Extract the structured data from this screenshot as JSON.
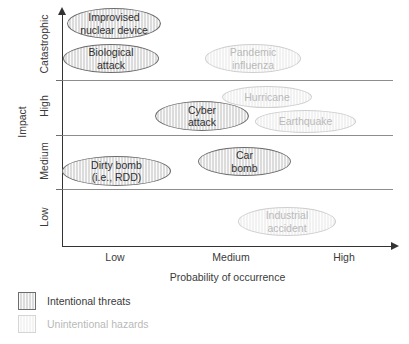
{
  "chart_data": {
    "type": "scatter",
    "title": "",
    "xlabel": "Probability of occurrence",
    "ylabel": "Impact",
    "x_tick_labels": [
      "Low",
      "Medium",
      "High"
    ],
    "y_tick_labels": [
      "Catastrophic",
      "High",
      "Medium",
      "Low"
    ],
    "grid": "horizontal band dividers only",
    "legend_position": "below-plot-left",
    "categories_legend": [
      {
        "key": "intentional",
        "label": "Intentional threats",
        "fill": "#dcdcdc",
        "stroke": "#6d6d6d",
        "text": "#2f2f2f"
      },
      {
        "key": "unintentional",
        "label": "Unintentional hazards",
        "fill": "#f2f2f2",
        "stroke": "#cfcfcf",
        "text": "#b9b9b9"
      }
    ],
    "points": [
      {
        "label": "Improvised\nnuclear device",
        "impact": "Catastrophic",
        "probability": "Low",
        "category": "intentional",
        "x": 67,
        "y": 8,
        "w": 94,
        "h": 31
      },
      {
        "label": "Biological\nattack",
        "impact": "Catastrophic",
        "probability": "Low",
        "category": "intentional",
        "x": 63,
        "y": 44,
        "w": 96,
        "h": 29
      },
      {
        "label": "Pandemic\ninfluenza",
        "impact": "Catastrophic",
        "probability": "Medium",
        "category": "unintentional",
        "x": 205,
        "y": 44,
        "w": 96,
        "h": 29
      },
      {
        "label": "Hurricane",
        "impact": "High",
        "probability": "Medium",
        "category": "unintentional",
        "x": 222,
        "y": 86,
        "w": 90,
        "h": 22
      },
      {
        "label": "Cyber\nattack",
        "impact": "High",
        "probability": "Medium",
        "category": "intentional",
        "x": 155,
        "y": 101,
        "w": 94,
        "h": 30
      },
      {
        "label": "Earthquake",
        "impact": "High",
        "probability": "High",
        "category": "unintentional",
        "x": 255,
        "y": 110,
        "w": 101,
        "h": 23
      },
      {
        "label": "Dirty bomb\n(i.e., RDD)",
        "impact": "Medium",
        "probability": "Low",
        "category": "intentional",
        "x": 62,
        "y": 156,
        "w": 109,
        "h": 30
      },
      {
        "label": "Car\nbomb",
        "impact": "Medium",
        "probability": "Medium",
        "category": "intentional",
        "x": 198,
        "y": 147,
        "w": 93,
        "h": 29
      },
      {
        "label": "Industrial\naccident",
        "impact": "Low",
        "probability": "Medium",
        "category": "unintentional",
        "x": 238,
        "y": 207,
        "w": 98,
        "h": 29
      }
    ],
    "band_dividers_y": [
      80,
      135,
      189
    ],
    "y_band_centers": {
      "Catastrophic": 47,
      "High": 108,
      "Medium": 162,
      "Low": 218
    },
    "x_tick_positions": {
      "Low": 115,
      "Medium": 231,
      "High": 344
    }
  },
  "axes": {
    "y_title": "Impact",
    "x_title": "Probability of occurrence",
    "y_categories": [
      "Catastrophic",
      "High",
      "Medium",
      "Low"
    ],
    "x_categories": [
      "Low",
      "Medium",
      "High"
    ]
  },
  "legend": {
    "intentional_label": "Intentional threats",
    "unintentional_label": "Unintentional hazards"
  }
}
